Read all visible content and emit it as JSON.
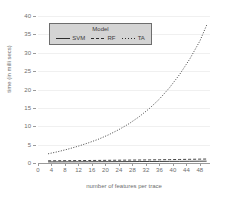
{
  "chart_data": {
    "type": "line",
    "title": "",
    "xlabel": "number of features per trace",
    "ylabel": "time (in milli secs)",
    "xlim": [
      0,
      51
    ],
    "ylim": [
      0,
      40
    ],
    "grid": true,
    "legend_title": "Model",
    "legend_position": "upper left",
    "xticks": [
      0,
      4,
      8,
      12,
      16,
      20,
      24,
      28,
      32,
      36,
      40,
      44,
      48
    ],
    "yticks": [
      0,
      5,
      10,
      15,
      20,
      25,
      30,
      35,
      40
    ],
    "x": [
      3,
      6,
      9,
      12,
      15,
      18,
      21,
      24,
      27,
      30,
      33,
      36,
      39,
      42,
      45,
      48,
      50
    ],
    "series": [
      {
        "name": "SVM",
        "style": "solid",
        "color": "#2e2e2e",
        "values": [
          0.3,
          0.31,
          0.32,
          0.33,
          0.34,
          0.35,
          0.36,
          0.37,
          0.38,
          0.4,
          0.41,
          0.42,
          0.44,
          0.45,
          0.47,
          0.49,
          0.5
        ]
      },
      {
        "name": "RF",
        "style": "dashed",
        "color": "#2e2e2e",
        "values": [
          0.6,
          0.62,
          0.64,
          0.66,
          0.68,
          0.7,
          0.73,
          0.76,
          0.79,
          0.82,
          0.85,
          0.88,
          0.92,
          0.96,
          1.0,
          1.05,
          1.08
        ]
      },
      {
        "name": "TA",
        "style": "dotted",
        "color": "#2e2e2e",
        "values": [
          2.5,
          3.1,
          3.8,
          4.6,
          5.5,
          6.5,
          7.7,
          9.1,
          10.7,
          12.6,
          14.8,
          17.4,
          20.5,
          24.1,
          28.3,
          33.2,
          37.5
        ]
      }
    ]
  }
}
